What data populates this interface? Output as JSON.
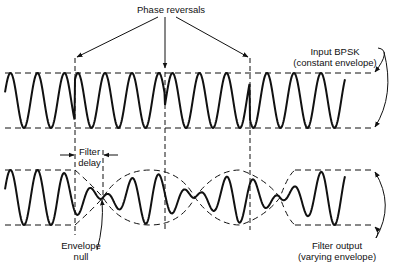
{
  "labels": {
    "phase_reversals": "Phase reversals",
    "input_line1": "Input BPSK",
    "input_line2": "(constant envelope)",
    "filter_delay_line1": "Filter",
    "filter_delay_line2": "delay",
    "envelope_null_line1": "Envelope",
    "envelope_null_line2": "null",
    "filter_output_line1": "Filter output",
    "filter_output_line2": "(varying envelope)"
  },
  "geometry": {
    "input_wave": {
      "x_start": 5,
      "x_end": 345,
      "top": 73,
      "bottom": 128,
      "period": 27
    },
    "output_wave": {
      "x_start": 5,
      "x_end": 345,
      "top": 170,
      "bottom": 225,
      "period": 27
    },
    "phase_reversal_x": [
      75,
      165,
      250
    ],
    "envelope_null_x": [
      103,
      195,
      280
    ],
    "envelope_line_x_end": 373
  },
  "colors": {
    "stroke": "#111111",
    "background": "#ffffff"
  }
}
